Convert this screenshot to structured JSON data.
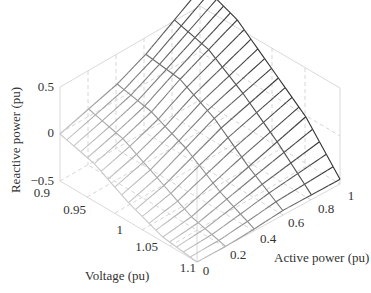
{
  "chart_data": {
    "type": "surface3d",
    "title": "",
    "xlabel": "Voltage (pu)",
    "ylabel": "Active power (pu)",
    "zlabel": "Reactive power (pu)",
    "x_ticks": [
      "0.9",
      "0.95",
      "1",
      "1.05",
      "1.1"
    ],
    "y_ticks": [
      "0",
      "0.2",
      "0.4",
      "0.6",
      "0.8",
      "1"
    ],
    "z_ticks": [
      "-0.5",
      "0",
      "0.5"
    ],
    "xlim": [
      0.9,
      1.1
    ],
    "ylim": [
      0,
      1
    ],
    "zlim": [
      -0.5,
      0.5
    ],
    "grid": true,
    "colormap": "gray (light at low active power, dark at high active power)",
    "x": [
      0.9,
      0.95,
      1.0,
      1.05,
      1.1
    ],
    "y": [
      0,
      0.2,
      0.4,
      0.6,
      0.8,
      1.0
    ],
    "z_description": "Reactive power decreases with voltage; high (~0.5+) at low voltage and high active power, near -0.5 at high voltage",
    "z": [
      [
        0.0,
        0.1,
        0.2,
        0.35,
        0.55,
        0.75
      ],
      [
        -0.1,
        0.0,
        0.12,
        0.3,
        0.45,
        0.6
      ],
      [
        -0.3,
        -0.2,
        -0.05,
        0.1,
        0.2,
        0.3
      ],
      [
        -0.45,
        -0.4,
        -0.3,
        -0.2,
        -0.1,
        0.0
      ],
      [
        -0.5,
        -0.5,
        -0.48,
        -0.45,
        -0.45,
        -0.45
      ]
    ]
  },
  "axes": {
    "z_label": "Reactive power (pu)",
    "x_label": "Voltage (pu)",
    "y_label": "Active power (pu)",
    "z_tick_labels": [
      "0.5",
      "0",
      "−0.5"
    ],
    "x_tick_labels": [
      "0.9",
      "0.95",
      "1",
      "1.05",
      "1.1"
    ],
    "y_tick_labels": [
      "0",
      "0.2",
      "0.4",
      "0.6",
      "0.8",
      "1"
    ]
  }
}
